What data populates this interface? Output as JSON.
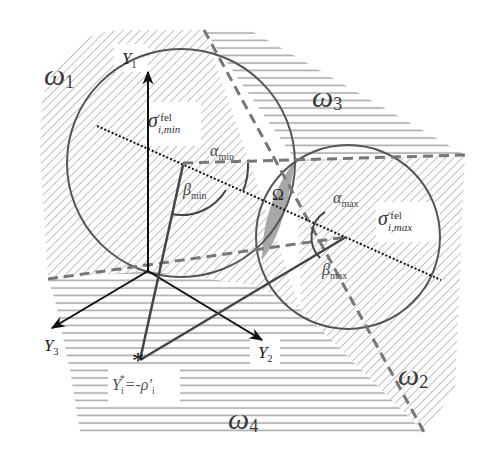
{
  "diagram": {
    "regions": [
      {
        "id": "omega1",
        "label": "ω",
        "subscript": "1",
        "hatch": "diagonal"
      },
      {
        "id": "omega2",
        "label": "ω",
        "subscript": "2",
        "hatch": "diagonal"
      },
      {
        "id": "omega3",
        "label": "ω",
        "subscript": "3",
        "hatch": "horizontal"
      },
      {
        "id": "omega4",
        "label": "ω",
        "subscript": "4",
        "hatch": "horizontal"
      }
    ],
    "axes": {
      "y1": {
        "label": "Y",
        "subscript": "1"
      },
      "y2": {
        "label": "Y",
        "subscript": "2"
      },
      "y3": {
        "label": "Y",
        "subscript": "3"
      }
    },
    "points": {
      "sigma_min": {
        "symbol": "σ",
        "superscript": "ʹfel",
        "subscript": "i,min"
      },
      "sigma_max": {
        "symbol": "σ",
        "superscript": "ʹfel",
        "subscript": "i,max"
      },
      "ystar": {
        "marker": "*",
        "lhs": "Y",
        "lhs_sub": "i",
        "lhs_sup": "*",
        "eq": "=-ρ",
        "rhs_prime": "ʹ",
        "rhs_sub": "i"
      }
    },
    "angles": {
      "alpha_min": {
        "symbol": "α",
        "subscript": "min"
      },
      "beta_min": {
        "symbol": "β",
        "subscript": "min"
      },
      "alpha_max": {
        "symbol": "α",
        "subscript": "max"
      },
      "beta_max": {
        "symbol": "β",
        "subscript": "max"
      }
    },
    "intersection": {
      "label": "Ω"
    },
    "colors": {
      "hatch": "#b8b8b8",
      "circle": "#555555",
      "axis": "#111111",
      "dashed": "#777777",
      "intersection_fill": "#a8a8a8"
    }
  }
}
